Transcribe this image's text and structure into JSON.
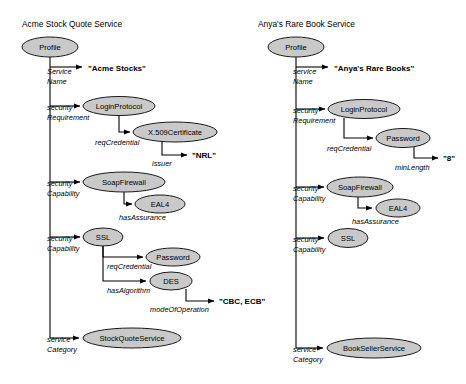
{
  "page": {
    "background": "#ffffff",
    "node_fill": "#c9c9c9",
    "node_stroke": "#1a1a1a",
    "edge_color": "#000000",
    "width": 466,
    "height": 384
  },
  "graphs": [
    {
      "id": "acme",
      "title": "Acme Stock Quote Service",
      "root": {
        "label": "Profile"
      },
      "nodes": [
        {
          "id": "acme-profile",
          "label": "Profile",
          "cx": 50,
          "cy": 47,
          "rx": 28,
          "ry": 10
        },
        {
          "id": "acme-loginprotocol",
          "label": "LoginProtocol",
          "cx": 119,
          "cy": 106,
          "rx": 36,
          "ry": 9.5
        },
        {
          "id": "acme-x509",
          "label": "X.509Certificate",
          "cx": 175,
          "cy": 132,
          "rx": 42,
          "ry": 10
        },
        {
          "id": "acme-soapfirewall",
          "label": "SoapFirewall",
          "cx": 124,
          "cy": 182,
          "rx": 41,
          "ry": 10
        },
        {
          "id": "acme-eal4",
          "label": "EAL4",
          "cx": 160,
          "cy": 204,
          "rx": 25,
          "ry": 9
        },
        {
          "id": "acme-ssl",
          "label": "SSL",
          "cx": 103,
          "cy": 237,
          "rx": 20,
          "ry": 9
        },
        {
          "id": "acme-password",
          "label": "Password",
          "cx": 173,
          "cy": 257,
          "rx": 27,
          "ry": 9
        },
        {
          "id": "acme-des",
          "label": "DES",
          "cx": 171,
          "cy": 281,
          "rx": 21,
          "ry": 9
        },
        {
          "id": "acme-stockquoteservice",
          "label": "StockQuoteService",
          "cx": 132,
          "cy": 338,
          "rx": 49,
          "ry": 10
        }
      ],
      "literals": [
        {
          "id": "acme-lit-name",
          "text": "\"Acme Stocks\"",
          "x": 88,
          "y": 71
        },
        {
          "id": "acme-lit-issuer",
          "text": "\"NRL\"",
          "x": 192,
          "y": 155
        },
        {
          "id": "acme-lit-mode",
          "text": "\"CBC, ECB\"",
          "x": 219,
          "y": 301
        }
      ],
      "edges": [
        {
          "id": "acme-e1",
          "label": [
            "Service",
            "Name"
          ],
          "label_x": 52,
          "label_y": 74
        },
        {
          "id": "acme-e2",
          "label": [
            "security",
            "Requirement"
          ],
          "label_x": 52,
          "label_y": 110
        },
        {
          "id": "acme-e3",
          "label": [
            "reqCredential"
          ],
          "label_x": 122,
          "label_y": 145
        },
        {
          "id": "acme-e4",
          "label": [
            "issuer"
          ],
          "label_x": 163,
          "label_y": 166
        },
        {
          "id": "acme-e5",
          "label": [
            "security",
            "Capability"
          ],
          "label_x": 52,
          "label_y": 186
        },
        {
          "id": "acme-e6",
          "label": [
            "hasAssurance"
          ],
          "label_x": 124,
          "label_y": 220
        },
        {
          "id": "acme-e7",
          "label": [
            "security",
            "Capability"
          ],
          "label_x": 52,
          "label_y": 241
        },
        {
          "id": "acme-e8",
          "label": [
            "reqCredential"
          ],
          "label_x": 106,
          "label_y": 269
        },
        {
          "id": "acme-e9",
          "label": [
            "hasAlgorithm"
          ],
          "label_x": 106,
          "label_y": 293
        },
        {
          "id": "acme-e10",
          "label": [
            "modeOfOperation"
          ],
          "label_x": 158,
          "label_y": 312
        },
        {
          "id": "acme-e11",
          "label": [
            "service",
            "Category"
          ],
          "label_x": 52,
          "label_y": 342
        }
      ]
    },
    {
      "id": "anya",
      "title": "Anya's Rare Book Service",
      "root": {
        "label": "Profile"
      },
      "nodes": [
        {
          "id": "anya-profile",
          "label": "Profile",
          "cx": 296,
          "cy": 47,
          "rx": 28,
          "ry": 10
        },
        {
          "id": "anya-loginprotocol",
          "label": "LoginProtocol",
          "cx": 364,
          "cy": 109,
          "rx": 36,
          "ry": 9.5
        },
        {
          "id": "anya-password",
          "label": "Password",
          "cx": 403,
          "cy": 138,
          "rx": 27,
          "ry": 9.5
        },
        {
          "id": "anya-soapfirewall",
          "label": "SoapFirewall",
          "cx": 360,
          "cy": 187,
          "rx": 33,
          "ry": 10
        },
        {
          "id": "anya-eal4",
          "label": "EAL4",
          "cx": 398,
          "cy": 208,
          "rx": 22,
          "ry": 9
        },
        {
          "id": "anya-ssl",
          "label": "SSL",
          "cx": 348,
          "cy": 238,
          "rx": 20,
          "ry": 9.5
        },
        {
          "id": "anya-booksellerservice",
          "label": "BookSellerService",
          "cx": 374,
          "cy": 348,
          "rx": 47,
          "ry": 10
        }
      ],
      "literals": [
        {
          "id": "anya-lit-name",
          "text": "\"Anya's Rare Books\"",
          "x": 334,
          "y": 71
        },
        {
          "id": "anya-lit-minlength",
          "text": "\"8\"",
          "x": 444,
          "y": 158
        }
      ],
      "edges": [
        {
          "id": "anya-e1",
          "label": [
            "service",
            "Name"
          ],
          "label_x": 298,
          "label_y": 74
        },
        {
          "id": "anya-e2",
          "label": [
            "security",
            "Requirement"
          ],
          "label_x": 298,
          "label_y": 113
        },
        {
          "id": "anya-e3",
          "label": [
            "reqCredential"
          ],
          "label_x": 360,
          "label_y": 151
        },
        {
          "id": "anya-e4",
          "label": [
            "minLength"
          ],
          "label_x": 405,
          "label_y": 169
        },
        {
          "id": "anya-e5",
          "label": [
            "security",
            "Capability"
          ],
          "label_x": 298,
          "label_y": 191
        },
        {
          "id": "anya-e6",
          "label": [
            "hasAssurance"
          ],
          "label_x": 360,
          "label_y": 224
        },
        {
          "id": "anya-e7",
          "label": [
            "security",
            "Capability"
          ],
          "label_x": 298,
          "label_y": 242
        },
        {
          "id": "anya-e8",
          "label": [
            "service",
            "Category"
          ],
          "label_x": 298,
          "label_y": 352
        }
      ]
    }
  ]
}
